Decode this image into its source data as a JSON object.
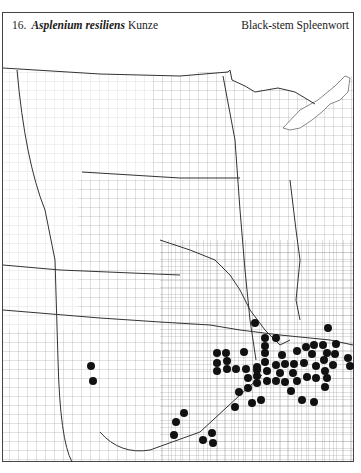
{
  "header": {
    "number": "16.",
    "scientific_name": "Asplenium resiliens",
    "author": "Kunze",
    "common_name": "Black-stem Spleenwort"
  },
  "map": {
    "description": "County outline map of the central United States showing distribution dots",
    "dot_color": "#111111",
    "line_color": "#555555",
    "dots": [
      [
        255,
        323
      ],
      [
        328,
        328
      ],
      [
        265,
        338
      ],
      [
        276,
        338
      ],
      [
        217,
        353
      ],
      [
        226,
        353
      ],
      [
        244,
        352
      ],
      [
        265,
        346
      ],
      [
        265,
        353
      ],
      [
        282,
        355
      ],
      [
        297,
        351
      ],
      [
        306,
        347
      ],
      [
        314,
        345
      ],
      [
        323,
        345
      ],
      [
        336,
        344
      ],
      [
        312,
        354
      ],
      [
        327,
        353
      ],
      [
        335,
        354
      ],
      [
        348,
        358
      ],
      [
        217,
        363
      ],
      [
        227,
        361
      ],
      [
        265,
        362
      ],
      [
        257,
        367
      ],
      [
        276,
        365
      ],
      [
        285,
        364
      ],
      [
        294,
        364
      ],
      [
        304,
        363
      ],
      [
        316,
        366
      ],
      [
        324,
        360
      ],
      [
        333,
        365
      ],
      [
        350,
        366
      ],
      [
        217,
        371
      ],
      [
        227,
        369
      ],
      [
        236,
        369
      ],
      [
        246,
        369
      ],
      [
        257,
        370
      ],
      [
        267,
        371
      ],
      [
        280,
        373
      ],
      [
        293,
        373
      ],
      [
        325,
        371
      ],
      [
        248,
        378
      ],
      [
        257,
        376
      ],
      [
        257,
        383
      ],
      [
        267,
        381
      ],
      [
        276,
        381
      ],
      [
        285,
        382
      ],
      [
        297,
        381
      ],
      [
        307,
        377
      ],
      [
        316,
        378
      ],
      [
        327,
        378
      ],
      [
        248,
        388
      ],
      [
        239,
        392
      ],
      [
        291,
        391
      ],
      [
        325,
        387
      ],
      [
        252,
        403
      ],
      [
        261,
        400
      ],
      [
        302,
        400
      ],
      [
        314,
        402
      ],
      [
        235,
        407
      ],
      [
        91,
        366
      ],
      [
        93,
        381
      ],
      [
        184,
        413
      ],
      [
        176,
        422
      ],
      [
        174,
        435
      ],
      [
        212,
        433
      ],
      [
        203,
        440
      ],
      [
        213,
        443
      ]
    ]
  }
}
